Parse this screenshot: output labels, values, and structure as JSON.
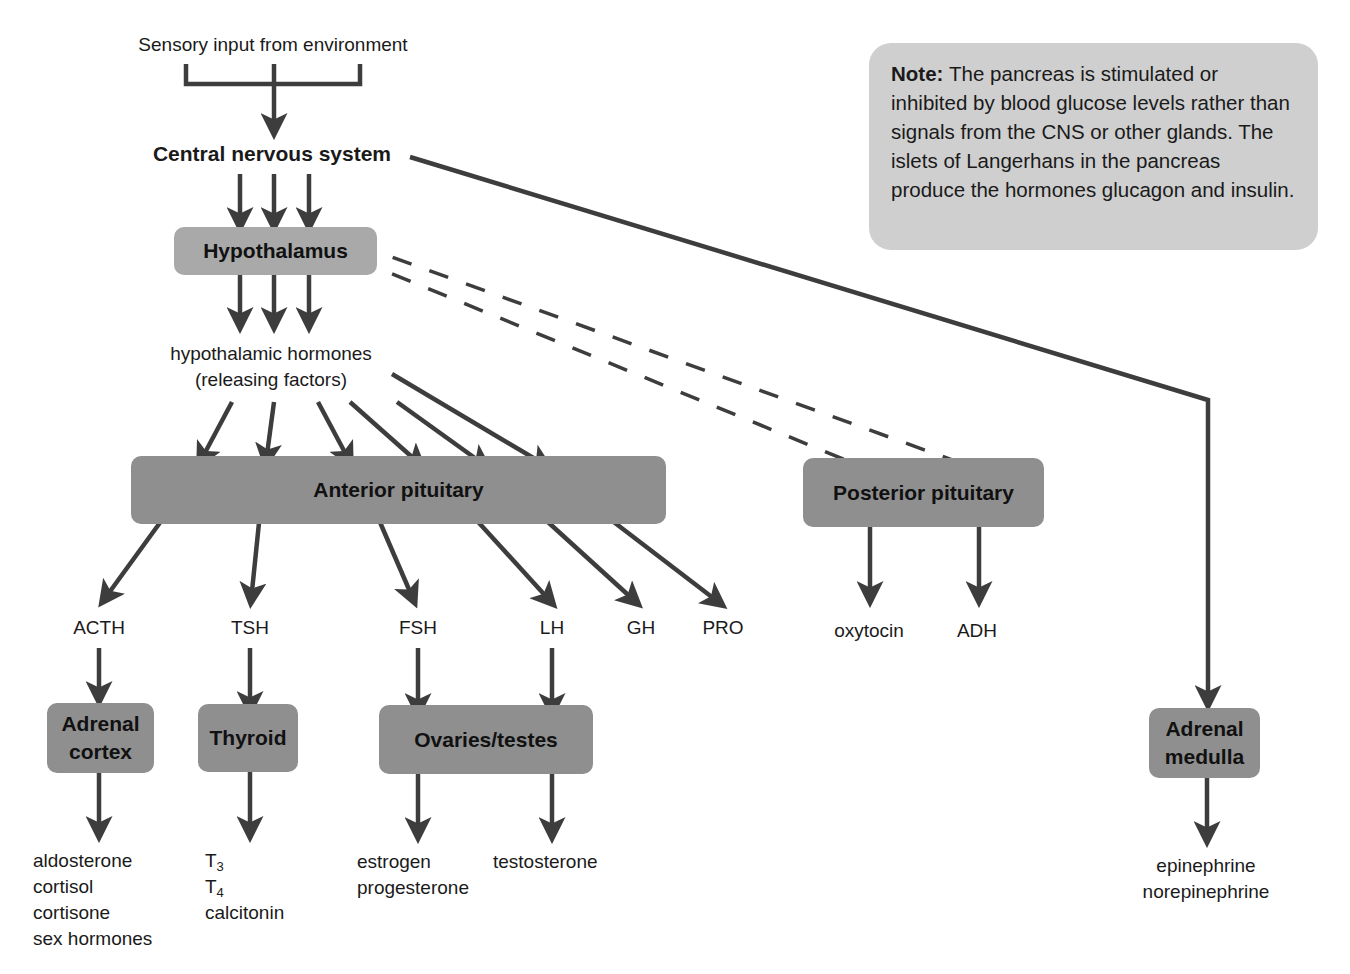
{
  "diagram": {
    "type": "endocrine-control-flowchart",
    "source_label": "Sensory input from environment",
    "cns_label": "Central nervous system",
    "hypothalamus_label": "Hypothalamus",
    "hypothalamic_hormones": {
      "line1": "hypothalamic hormones",
      "line2": "(releasing factors)"
    },
    "anterior_pituitary_label": "Anterior pituitary",
    "posterior_pituitary_label": "Posterior pituitary",
    "anterior_hormones": [
      "ACTH",
      "TSH",
      "FSH",
      "LH",
      "GH",
      "PRO"
    ],
    "posterior_hormones": [
      "oxytocin",
      "ADH"
    ],
    "glands": {
      "adrenal_cortex": {
        "line1": "Adrenal",
        "line2": "cortex"
      },
      "thyroid": "Thyroid",
      "ovaries_testes": "Ovaries/testes",
      "adrenal_medulla": {
        "line1": "Adrenal",
        "line2": "medulla"
      }
    },
    "products": {
      "adrenal_cortex": [
        "aldosterone",
        "cortisol",
        "cortisone",
        "sex hormones"
      ],
      "thyroid": [
        {
          "base": "T",
          "sub": "3"
        },
        {
          "base": "T",
          "sub": "4"
        },
        {
          "base": "calcitonin",
          "sub": ""
        }
      ],
      "ovaries_fsh": [
        "estrogen",
        "progesterone"
      ],
      "testes_lh": [
        "testosterone"
      ],
      "adrenal_medulla": [
        "epinephrine",
        "norepinephrine"
      ]
    },
    "note": {
      "title": "Note:",
      "text": "The pancreas is stimulated or inhibited by blood glucose levels rather than signals from the CNS or other glands. The islets of Langerhans in the pancreas produce the hormones glucagon and insulin."
    },
    "colors": {
      "arrow": "#3d3d3d",
      "box_light": "#a9a9a9",
      "box_mid": "#8f8f8f",
      "note_bg": "#cfcfcf",
      "background": "#ffffff"
    }
  }
}
